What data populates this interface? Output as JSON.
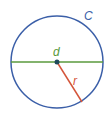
{
  "diagram": {
    "labels": {
      "circumference": "C",
      "diameter": "d",
      "radius": "r"
    },
    "colors": {
      "circle": "#3b5fa8",
      "diameter": "#5a9a3c",
      "radius": "#d4553a",
      "center_dot": "#1f4a5c",
      "circumference_label": "#3b5fa8",
      "diameter_label": "#5a9a3c",
      "radius_label": "#d4553a"
    }
  }
}
